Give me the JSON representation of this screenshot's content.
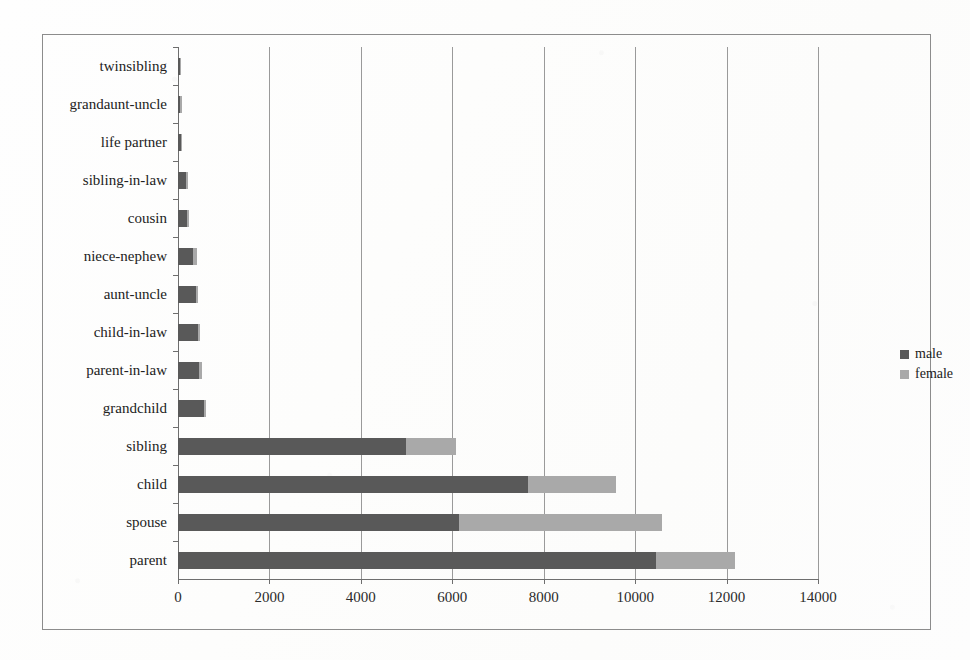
{
  "chart_data": {
    "type": "bar",
    "orientation": "horizontal",
    "stacked": true,
    "title": "",
    "xlabel": "",
    "ylabel": "",
    "xlim": [
      0,
      14000
    ],
    "xticks": [
      0,
      2000,
      4000,
      6000,
      8000,
      10000,
      12000,
      14000
    ],
    "xtick_labels": [
      "0",
      "2000",
      "4000",
      "6000",
      "8000",
      "10000",
      "12000",
      "14000"
    ],
    "grid": true,
    "grid_axis": "x",
    "legend_position": "right",
    "categories": [
      "twinsibling",
      "grandaunt-uncle",
      "life partner",
      "sibling-in-law",
      "cousin",
      "niece-nephew",
      "aunt-uncle",
      "child-in-law",
      "parent-in-law",
      "grandchild",
      "sibling",
      "child",
      "spouse",
      "parent"
    ],
    "series": [
      {
        "name": "male",
        "color": "#595959",
        "values": [
          40,
          45,
          55,
          175,
          200,
          330,
          390,
          430,
          470,
          570,
          4990,
          7650,
          6150,
          10450
        ]
      },
      {
        "name": "female",
        "color": "#a9a9a9",
        "values": [
          10,
          10,
          10,
          30,
          25,
          75,
          55,
          55,
          50,
          10,
          1090,
          1930,
          4440,
          1730
        ]
      }
    ],
    "totals": [
      50,
      55,
      65,
      205,
      225,
      405,
      445,
      485,
      520,
      580,
      6080,
      9580,
      10590,
      12180
    ]
  },
  "legend": {
    "items": [
      {
        "label": "male",
        "color": "#595959"
      },
      {
        "label": "female",
        "color": "#a9a9a9"
      }
    ]
  }
}
